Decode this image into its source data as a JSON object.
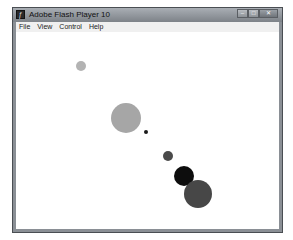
{
  "window": {
    "title": "Adobe Flash Player 10",
    "controls": {
      "minimize": "minimize-icon",
      "maximize": "maximize-icon",
      "close": "close-icon"
    }
  },
  "menubar": {
    "items": [
      {
        "label": "File"
      },
      {
        "label": "View"
      },
      {
        "label": "Control"
      },
      {
        "label": "Help"
      }
    ]
  },
  "stage": {
    "circles": [
      {
        "cx": 81,
        "cy": 66,
        "r": 5,
        "color": "#b3b3b3"
      },
      {
        "cx": 126,
        "cy": 118,
        "r": 15,
        "color": "#a6a6a6"
      },
      {
        "cx": 146,
        "cy": 132,
        "r": 2,
        "color": "#1a1a1a"
      },
      {
        "cx": 168,
        "cy": 156,
        "r": 5,
        "color": "#4a4a4a"
      },
      {
        "cx": 184,
        "cy": 176,
        "r": 10,
        "color": "#0d0d0d"
      },
      {
        "cx": 198,
        "cy": 194,
        "r": 14,
        "color": "#474747"
      }
    ]
  }
}
